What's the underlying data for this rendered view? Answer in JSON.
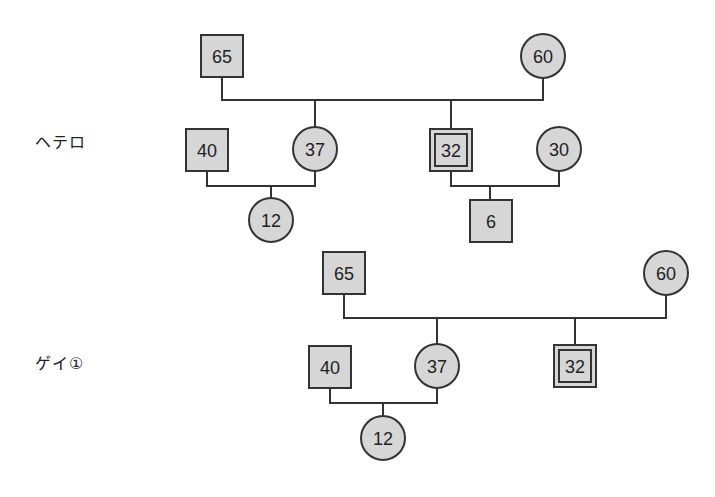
{
  "colors": {
    "node_fill": "#d6d6d6",
    "stroke": "#333333",
    "background": "#ffffff"
  },
  "sections": [
    {
      "label": "ヘテロ",
      "nodes": {
        "grandfather": {
          "shape": "square",
          "age": "65"
        },
        "grandmother": {
          "shape": "circle",
          "age": "60"
        },
        "daughter_husband": {
          "shape": "square",
          "age": "40"
        },
        "daughter": {
          "shape": "circle",
          "age": "37"
        },
        "son": {
          "shape": "double-square",
          "age": "32",
          "note": "identified person"
        },
        "son_wife": {
          "shape": "circle",
          "age": "30"
        },
        "granddaughter": {
          "shape": "circle",
          "age": "12"
        },
        "grandson": {
          "shape": "square",
          "age": "6"
        }
      }
    },
    {
      "label": "ゲイ①",
      "nodes": {
        "grandfather": {
          "shape": "square",
          "age": "65"
        },
        "grandmother": {
          "shape": "circle",
          "age": "60"
        },
        "daughter_husband": {
          "shape": "square",
          "age": "40"
        },
        "daughter": {
          "shape": "circle",
          "age": "37"
        },
        "son": {
          "shape": "double-square",
          "age": "32",
          "note": "identified person"
        },
        "granddaughter": {
          "shape": "circle",
          "age": "12"
        }
      }
    }
  ]
}
